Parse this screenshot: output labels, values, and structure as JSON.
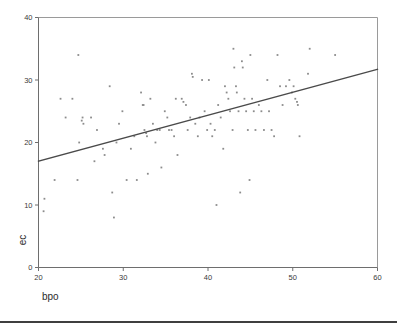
{
  "chart_data": {
    "type": "scatter",
    "title": "",
    "subtitle": "",
    "xlabel": "bpo",
    "ylabel": "ec",
    "xlim": [
      20,
      60
    ],
    "ylim": [
      0,
      40
    ],
    "xticks": [
      20,
      30,
      40,
      50,
      60
    ],
    "yticks": [
      0,
      10,
      20,
      30,
      40
    ],
    "xtick_labels": [
      "20",
      "30",
      "40",
      "50",
      "60"
    ],
    "ytick_labels": [
      "0",
      "10",
      "20",
      "30",
      "40"
    ],
    "grid": false,
    "legend": null,
    "marker_color": "#8c8c8c",
    "line_color": "#4a4a4a",
    "frame_color": "#9a9a9a",
    "fit_line": {
      "name": "linear fit",
      "x": [
        20,
        60
      ],
      "y": [
        17.0,
        31.7
      ],
      "slope": 0.3675,
      "intercept": 9.65
    },
    "series": [
      {
        "name": "ec vs bpo",
        "points": [
          [
            20.7,
            11.0
          ],
          [
            20.6,
            9.0
          ],
          [
            21.9,
            14.0
          ],
          [
            22.6,
            27.0
          ],
          [
            23.2,
            24.0
          ],
          [
            24.0,
            27.0
          ],
          [
            24.7,
            34.0
          ],
          [
            24.8,
            20.0
          ],
          [
            24.6,
            14.0
          ],
          [
            25.1,
            23.5
          ],
          [
            25.2,
            24.0
          ],
          [
            25.3,
            23.0
          ],
          [
            26.2,
            24.0
          ],
          [
            26.6,
            17.0
          ],
          [
            26.9,
            22.0
          ],
          [
            27.6,
            19.0
          ],
          [
            27.8,
            18.0
          ],
          [
            28.4,
            29.0
          ],
          [
            28.7,
            12.0
          ],
          [
            28.9,
            8.0
          ],
          [
            29.2,
            20.0
          ],
          [
            29.5,
            23.0
          ],
          [
            29.9,
            25.0
          ],
          [
            30.4,
            14.0
          ],
          [
            30.9,
            19.0
          ],
          [
            31.3,
            21.0
          ],
          [
            31.6,
            14.0
          ],
          [
            32.1,
            28.0
          ],
          [
            32.3,
            26.0
          ],
          [
            32.4,
            26.0
          ],
          [
            32.5,
            22.0
          ],
          [
            32.7,
            21.5
          ],
          [
            32.8,
            21.0
          ],
          [
            32.9,
            15.0
          ],
          [
            33.2,
            27.0
          ],
          [
            33.5,
            23.0
          ],
          [
            33.8,
            20.0
          ],
          [
            34.0,
            22.0
          ],
          [
            34.3,
            22.0
          ],
          [
            34.5,
            16.0
          ],
          [
            34.9,
            25.0
          ],
          [
            35.2,
            24.0
          ],
          [
            35.4,
            22.0
          ],
          [
            35.7,
            22.0
          ],
          [
            36.0,
            21.0
          ],
          [
            36.2,
            27.0
          ],
          [
            36.4,
            18.0
          ],
          [
            36.9,
            27.0
          ],
          [
            37.1,
            26.5
          ],
          [
            37.4,
            26.0
          ],
          [
            37.6,
            22.0
          ],
          [
            37.9,
            24.0
          ],
          [
            38.1,
            31.0
          ],
          [
            38.2,
            30.5
          ],
          [
            38.5,
            23.0
          ],
          [
            38.8,
            21.0
          ],
          [
            39.0,
            24.0
          ],
          [
            39.3,
            30.0
          ],
          [
            39.6,
            25.0
          ],
          [
            39.9,
            22.0
          ],
          [
            40.1,
            30.0
          ],
          [
            40.3,
            23.0
          ],
          [
            40.5,
            21.0
          ],
          [
            40.8,
            22.0
          ],
          [
            41.0,
            10.0
          ],
          [
            41.2,
            26.0
          ],
          [
            41.5,
            24.0
          ],
          [
            41.8,
            19.0
          ],
          [
            42.0,
            29.0
          ],
          [
            42.2,
            28.0
          ],
          [
            42.4,
            27.0
          ],
          [
            42.6,
            25.0
          ],
          [
            42.9,
            22.0
          ],
          [
            43.0,
            35.0
          ],
          [
            43.1,
            32.0
          ],
          [
            43.3,
            29.0
          ],
          [
            43.4,
            28.0
          ],
          [
            43.6,
            25.0
          ],
          [
            43.8,
            12.0
          ],
          [
            44.0,
            33.0
          ],
          [
            44.1,
            32.0
          ],
          [
            44.3,
            27.0
          ],
          [
            44.5,
            25.0
          ],
          [
            44.7,
            22.0
          ],
          [
            44.9,
            14.0
          ],
          [
            45.0,
            34.0
          ],
          [
            45.2,
            27.0
          ],
          [
            45.4,
            25.0
          ],
          [
            45.6,
            22.0
          ],
          [
            46.0,
            26.0
          ],
          [
            46.3,
            25.0
          ],
          [
            46.6,
            22.0
          ],
          [
            47.0,
            30.0
          ],
          [
            47.2,
            25.0
          ],
          [
            47.5,
            22.0
          ],
          [
            47.8,
            21.0
          ],
          [
            48.2,
            34.0
          ],
          [
            48.5,
            29.0
          ],
          [
            48.8,
            26.0
          ],
          [
            49.2,
            29.0
          ],
          [
            49.6,
            30.0
          ],
          [
            49.9,
            28.0
          ],
          [
            50.1,
            29.0
          ],
          [
            50.3,
            27.0
          ],
          [
            50.5,
            26.5
          ],
          [
            50.6,
            26.0
          ],
          [
            50.8,
            21.0
          ],
          [
            51.8,
            31.0
          ],
          [
            52.0,
            35.0
          ],
          [
            55.0,
            34.0
          ]
        ]
      }
    ]
  }
}
